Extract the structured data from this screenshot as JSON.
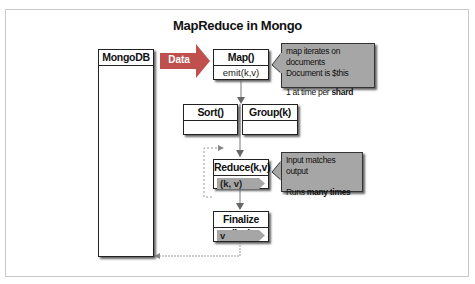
{
  "title": "MapReduce in Mongo",
  "colors": {
    "arrow": "#c0504d",
    "callout_bg": "#a6a6a6",
    "tag_bg": "#a6a6a6",
    "connector": "#777777",
    "dashed": "#999999"
  },
  "mongodb": {
    "label": "MongoDB"
  },
  "data_arrow": {
    "label": "Data"
  },
  "map": {
    "label": "Map()",
    "sub": "emit(k,v)"
  },
  "map_note": {
    "line1": "map iterates on documents",
    "line2": "Document is $this",
    "line3_prefix": "1 at time per ",
    "line3_bold": "shard"
  },
  "sort": {
    "label": "Sort()"
  },
  "group": {
    "label": "Group(k)"
  },
  "reduce": {
    "label": "Reduce(k,v)",
    "tag": "(k, v)"
  },
  "reduce_note": {
    "line1": "Input matches output",
    "line2_prefix": "Runs ",
    "line2_bold": "many times"
  },
  "finalize": {
    "label": "Finalize (k,v)",
    "tag": "v"
  }
}
